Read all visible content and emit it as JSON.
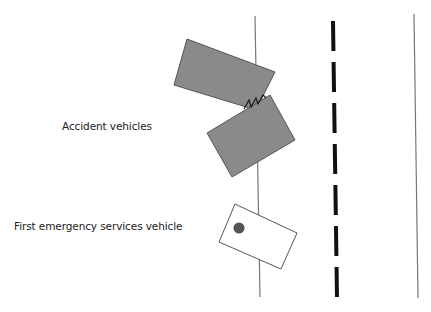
{
  "labels": {
    "accident": "Accident vehicles",
    "first_emergency": "First emergency services vehicle"
  },
  "colors": {
    "vehicle_fill": "#8a8a8a",
    "vehicle_stroke": "#555555",
    "lane_line": "#777777",
    "dash": "#111111",
    "emergency_dot": "#555555"
  }
}
